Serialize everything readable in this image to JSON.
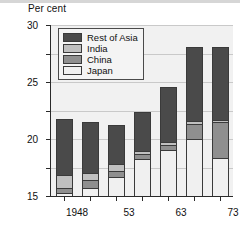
{
  "figure": {
    "axis_title": "Per cent",
    "caption": ""
  },
  "legend": {
    "position": "top-left-inside",
    "items": [
      {
        "label": "Rest of Asia",
        "color": "#4a4a4a"
      },
      {
        "label": "India",
        "color": "#c0c0c0"
      },
      {
        "label": "China",
        "color": "#8f8f8f"
      },
      {
        "label": "Japan",
        "color": "#f0f0f0"
      }
    ]
  },
  "chart_data": {
    "type": "bar",
    "subtype": "stacked",
    "title": "",
    "xlabel": "",
    "ylabel": "Per cent",
    "ylim": [
      0,
      30
    ],
    "yticks": [
      0,
      5,
      10,
      15,
      20,
      25,
      30
    ],
    "ytick_labels": [
      "0",
      "5",
      "10",
      "15",
      "20",
      "25",
      "30"
    ],
    "grid": true,
    "categories": [
      "1948",
      "53",
      "63",
      "73",
      "83",
      "93",
      "2003"
    ],
    "series": [
      {
        "name": "Japan",
        "color": "#f0f0f0",
        "values": [
          0.5,
          1.4,
          3.3,
          6.5,
          8.0,
          10.0,
          6.6
        ]
      },
      {
        "name": "China",
        "color": "#8f8f8f",
        "values": [
          0.9,
          1.4,
          1.1,
          0.9,
          1.0,
          2.7,
          6.4
        ]
      },
      {
        "name": "India",
        "color": "#c0c0c0",
        "values": [
          2.2,
          1.2,
          1.2,
          0.5,
          0.5,
          0.5,
          0.3
        ]
      },
      {
        "name": "Rest of Asia",
        "color": "#4a4a4a",
        "values": [
          9.9,
          9.0,
          6.8,
          6.9,
          9.7,
          12.9,
          12.8
        ]
      }
    ],
    "totals": [
      13.5,
      13.0,
      12.4,
      14.8,
      19.2,
      26.1,
      26.1
    ]
  }
}
